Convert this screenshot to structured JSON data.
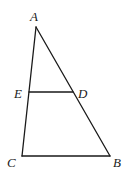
{
  "diagram": {
    "type": "triangle-with-segment",
    "points": {
      "A": {
        "label": "A",
        "x": 36,
        "y": 27,
        "label_x": 30,
        "label_y": 21
      },
      "B": {
        "label": "B",
        "x": 110,
        "y": 156,
        "label_x": 113,
        "label_y": 167
      },
      "C": {
        "label": "C",
        "x": 22,
        "y": 156,
        "label_x": 7,
        "label_y": 167
      },
      "D": {
        "label": "D",
        "x": 73,
        "y": 92,
        "label_x": 78,
        "label_y": 98
      },
      "E": {
        "label": "E",
        "x": 29,
        "y": 92,
        "label_x": 14,
        "label_y": 98
      }
    },
    "segments": [
      {
        "from": "A",
        "to": "B"
      },
      {
        "from": "A",
        "to": "C"
      },
      {
        "from": "C",
        "to": "B"
      },
      {
        "from": "E",
        "to": "D"
      }
    ],
    "stroke_color": "#1a1a1a"
  }
}
